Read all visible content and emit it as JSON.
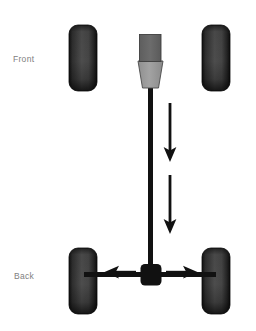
{
  "diagram": {
    "background_color": "#ffffff",
    "width": 256,
    "height": 331,
    "labels": {
      "front": "Front",
      "back": "Back",
      "label_color": "#808080"
    },
    "colors": {
      "tire_dark": "#1a1a1a",
      "tire_mid": "#4a4a4a",
      "tire_light": "#565656",
      "engine_block": "#666666",
      "transmission": "#9a9a9a",
      "outline": "#333333",
      "driveshaft": "#111111",
      "differential": "#111111",
      "arrow": "#111111",
      "axle": "#111111"
    },
    "parts": [
      {
        "id": "tire-front-left",
        "name": "Front left tire",
        "shape": "rounded-rect",
        "x": 69,
        "y": 25,
        "width": 28,
        "height": 66,
        "radius": 9
      },
      {
        "id": "tire-front-right",
        "name": "Front right tire",
        "shape": "rounded-rect",
        "x": 202,
        "y": 25,
        "width": 28,
        "height": 66,
        "radius": 9
      },
      {
        "id": "tire-rear-left",
        "name": "Rear left tire",
        "shape": "rounded-rect",
        "x": 69,
        "y": 248,
        "width": 28,
        "height": 66,
        "radius": 9
      },
      {
        "id": "tire-rear-right",
        "name": "Rear right tire",
        "shape": "rounded-rect",
        "x": 202,
        "y": 248,
        "width": 28,
        "height": 66,
        "radius": 9
      },
      {
        "id": "engine-block",
        "name": "Engine block",
        "shape": "rect",
        "x": 140,
        "y": 35,
        "width": 21,
        "height": 26
      },
      {
        "id": "transmission",
        "name": "Transmission housing",
        "shape": "trapezoid",
        "top_left_x": 138,
        "top_right_x": 163,
        "bottom_left_x": 143,
        "bottom_right_x": 158,
        "top_y": 61,
        "bottom_y": 88
      },
      {
        "id": "driveshaft",
        "name": "Driveshaft",
        "shape": "vertical-bar",
        "x": 148,
        "y": 86,
        "width": 5,
        "height": 190
      },
      {
        "id": "differential",
        "name": "Rear differential",
        "shape": "rounded-rect",
        "x": 141,
        "y": 264,
        "width": 20,
        "height": 21,
        "radius": 4
      },
      {
        "id": "rear-axle",
        "name": "Rear axle",
        "shape": "horizontal-bar",
        "x": 85,
        "y": 272,
        "width": 130,
        "height": 5
      }
    ],
    "arrows": [
      {
        "id": "arrow-driveshaft-upper",
        "name": "Driveshaft torque arrow (upper)",
        "direction": "down",
        "x": 170,
        "y1": 103,
        "y2": 160
      },
      {
        "id": "arrow-driveshaft-lower",
        "name": "Driveshaft torque arrow (lower)",
        "direction": "down",
        "x": 170,
        "y1": 175,
        "y2": 232
      },
      {
        "id": "arrow-axle-left",
        "name": "Left axle torque arrow",
        "direction": "left",
        "y": 272,
        "x1": 135,
        "x2": 106
      },
      {
        "id": "arrow-axle-right",
        "name": "Right axle torque arrow",
        "direction": "right",
        "y": 272,
        "x1": 167,
        "x2": 196
      }
    ]
  }
}
